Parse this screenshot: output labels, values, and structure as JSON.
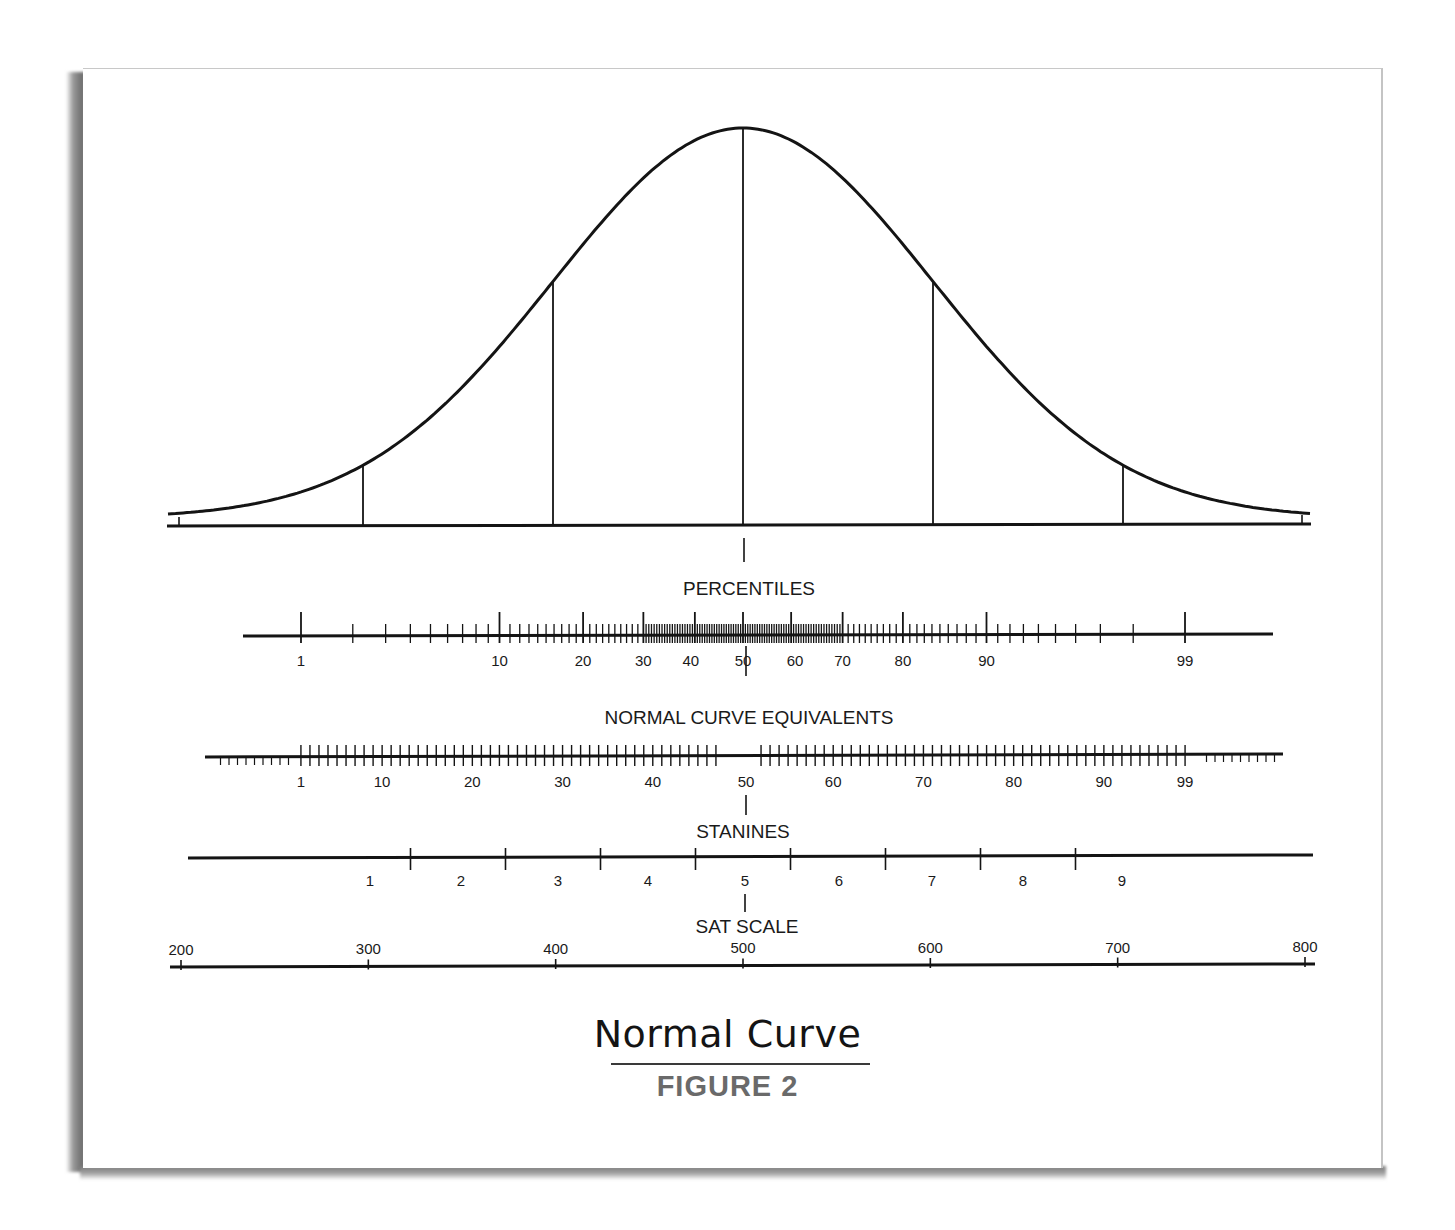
{
  "figure": {
    "title": "Normal Curve",
    "subtitle": "FIGURE 2"
  },
  "scales": {
    "percentiles": "PERCENTILES",
    "nce": "NORMAL CURVE EQUIVALENTS",
    "stanines": "STANINES",
    "sat": "SAT SCALE"
  },
  "colors": {
    "ink": "#141414",
    "subtitle": "#6a6a6a",
    "paper": "#ffffff",
    "shadow": "#7a7a7a"
  },
  "chart_data": {
    "type": "line",
    "title": "Normal Curve",
    "subtitle": "FIGURE 2",
    "curve": {
      "distribution": "normal",
      "mean": 0,
      "sd": 1,
      "x_range_sd": [
        -3,
        3
      ],
      "reference_lines_sd": [
        -2,
        -1,
        0,
        1,
        2
      ]
    },
    "axes": [
      {
        "name": "PERCENTILES",
        "labels": [
          1,
          10,
          20,
          30,
          40,
          50,
          60,
          70,
          80,
          90,
          99
        ],
        "note": "log-spaced tick marks densest near 50"
      },
      {
        "name": "NORMAL CURVE EQUIVALENTS",
        "labels": [
          1,
          10,
          20,
          30,
          40,
          50,
          60,
          70,
          80,
          90,
          99
        ],
        "range": [
          1,
          99
        ],
        "note": "evenly spaced ticks every 1 NCE unit"
      },
      {
        "name": "STANINES",
        "labels": [
          1,
          2,
          3,
          4,
          5,
          6,
          7,
          8,
          9
        ],
        "boundaries_sd": [
          -1.75,
          -1.25,
          -0.75,
          -0.25,
          0.25,
          0.75,
          1.25,
          1.75
        ]
      },
      {
        "name": "SAT SCALE",
        "labels": [
          200,
          300,
          400,
          500,
          600,
          700,
          800
        ],
        "range": [
          200,
          800
        ]
      }
    ],
    "xlabel": "",
    "ylabel": "",
    "grid": false,
    "legend": "none"
  }
}
